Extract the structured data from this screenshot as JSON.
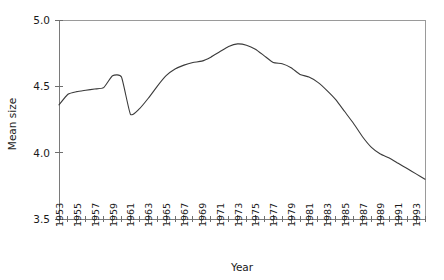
{
  "chart_data": {
    "type": "line",
    "title": "",
    "subtitle": "",
    "xlabel": "Year",
    "ylabel": "Mean size",
    "xlim": [
      1953,
      1994
    ],
    "ylim": [
      3.5,
      5.0
    ],
    "yticks": [
      "3.5",
      "4.0",
      "4.5",
      "5.0"
    ],
    "ytick_values": [
      3.5,
      4.0,
      4.5,
      5.0
    ],
    "grid": false,
    "legend": null,
    "legend_position": "none",
    "annotations": [],
    "axis_frame": "box",
    "line_color": "#3a3a3a",
    "xtick_labels": [
      "1953",
      "1955",
      "1957",
      "1959",
      "1961",
      "1963",
      "1965",
      "1967",
      "1969",
      "1971",
      "1973",
      "1975",
      "1977",
      "1979",
      "1981",
      "1983",
      "1985",
      "1987",
      "1989",
      "1991",
      "1993"
    ],
    "xtick_minor_every": 1,
    "xtick_label_every": 2,
    "x": [
      1953,
      1954,
      1955,
      1956,
      1957,
      1958,
      1959,
      1960,
      1961,
      1962,
      1963,
      1964,
      1965,
      1966,
      1967,
      1968,
      1969,
      1970,
      1971,
      1972,
      1973,
      1974,
      1975,
      1976,
      1977,
      1978,
      1979,
      1980,
      1981,
      1982,
      1983,
      1984,
      1985,
      1986,
      1987,
      1988,
      1989,
      1990,
      1991,
      1992,
      1993,
      1994
    ],
    "values": [
      4.36,
      4.44,
      4.46,
      4.47,
      4.48,
      4.49,
      4.58,
      4.57,
      4.29,
      4.33,
      4.41,
      4.5,
      4.58,
      4.63,
      4.66,
      4.68,
      4.69,
      4.72,
      4.76,
      4.8,
      4.82,
      4.81,
      4.78,
      4.73,
      4.68,
      4.67,
      4.64,
      4.59,
      4.57,
      4.53,
      4.47,
      4.4,
      4.31,
      4.22,
      4.12,
      4.04,
      3.99,
      3.96,
      3.92,
      3.88,
      3.84,
      3.8
    ],
    "series": [
      {
        "name": "Mean size",
        "values": [
          4.36,
          4.44,
          4.46,
          4.47,
          4.48,
          4.49,
          4.58,
          4.57,
          4.29,
          4.33,
          4.41,
          4.5,
          4.58,
          4.63,
          4.66,
          4.68,
          4.69,
          4.72,
          4.76,
          4.8,
          4.82,
          4.81,
          4.78,
          4.73,
          4.68,
          4.67,
          4.64,
          4.59,
          4.57,
          4.53,
          4.47,
          4.4,
          4.31,
          4.22,
          4.12,
          4.04,
          3.99,
          3.96,
          3.92,
          3.88,
          3.84,
          3.8
        ]
      }
    ]
  },
  "axes": {
    "y_title": "Mean size",
    "x_title": "Year"
  }
}
